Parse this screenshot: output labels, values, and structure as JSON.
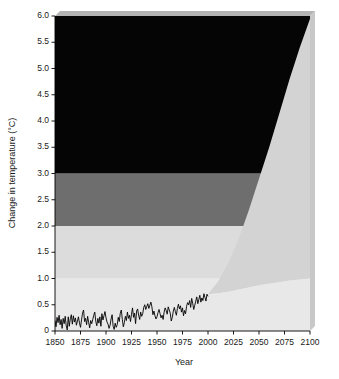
{
  "chart_data": {
    "type": "area",
    "title": "",
    "xlabel": "Year",
    "ylabel": "Change in temperature (°C)",
    "xlim": [
      1850,
      2100
    ],
    "ylim": [
      0,
      6.0
    ],
    "grid": false,
    "legend": "none",
    "xticks": [
      1850,
      1875,
      1900,
      1925,
      1950,
      1975,
      2000,
      2025,
      2050,
      2075,
      2100
    ],
    "xtick_labels": [
      "1850",
      "1875",
      "1900",
      "1925",
      "1950",
      "1975",
      "2000",
      "2025",
      "2050",
      "2075",
      "2100"
    ],
    "yticks": [
      0,
      0.5,
      1.0,
      1.5,
      2.0,
      2.5,
      3.0,
      3.5,
      4.0,
      4.5,
      5.0,
      5.5,
      6.0
    ],
    "ytick_labels": [
      "0",
      "0.5",
      "1.0",
      "1.5",
      "2.0",
      "2.5",
      "3.0",
      "3.5",
      "4.0",
      "4.5",
      "5.0",
      "5.5",
      "6.0"
    ],
    "risk_bands": [
      {
        "name": "low-risk-band",
        "from": 0,
        "to": 1.0,
        "color": "#e8e8e8"
      },
      {
        "name": "moderate-risk-band",
        "from": 1.0,
        "to": 2.0,
        "color": "#dcdcdc"
      },
      {
        "name": "high-risk-band",
        "from": 2.0,
        "to": 3.0,
        "color": "#6e6e6e"
      },
      {
        "name": "severe-risk-band",
        "from": 3.0,
        "to": 6.0,
        "color": "#050505"
      }
    ],
    "projection_cone": {
      "name": "projection-uncertainty-cone",
      "color": "#d3d3d3",
      "start_year": 2000,
      "start_value": 0.7,
      "upper_bound": {
        "x": [
          2000,
          2010,
          2020,
          2030,
          2040,
          2050,
          2060,
          2070,
          2080,
          2090,
          2100
        ],
        "y": [
          0.7,
          0.95,
          1.3,
          1.75,
          2.3,
          2.9,
          3.5,
          4.15,
          4.8,
          5.4,
          5.95
        ]
      },
      "lower_bound": {
        "x": [
          2000,
          2010,
          2020,
          2030,
          2040,
          2050,
          2060,
          2070,
          2080,
          2090,
          2100
        ],
        "y": [
          0.7,
          0.72,
          0.75,
          0.79,
          0.83,
          0.87,
          0.9,
          0.93,
          0.96,
          0.98,
          1.0
        ]
      }
    },
    "series": [
      {
        "name": "observed-temperature",
        "color": "#000000",
        "x": [
          1850,
          1851,
          1852,
          1853,
          1854,
          1855,
          1856,
          1857,
          1858,
          1859,
          1860,
          1861,
          1862,
          1863,
          1864,
          1865,
          1866,
          1867,
          1868,
          1869,
          1870,
          1871,
          1872,
          1873,
          1874,
          1875,
          1876,
          1877,
          1878,
          1879,
          1880,
          1881,
          1882,
          1883,
          1884,
          1885,
          1886,
          1887,
          1888,
          1889,
          1890,
          1891,
          1892,
          1893,
          1894,
          1895,
          1896,
          1897,
          1898,
          1899,
          1900,
          1901,
          1902,
          1903,
          1904,
          1905,
          1906,
          1907,
          1908,
          1909,
          1910,
          1911,
          1912,
          1913,
          1914,
          1915,
          1916,
          1917,
          1918,
          1919,
          1920,
          1921,
          1922,
          1923,
          1924,
          1925,
          1926,
          1927,
          1928,
          1929,
          1930,
          1931,
          1932,
          1933,
          1934,
          1935,
          1936,
          1937,
          1938,
          1939,
          1940,
          1941,
          1942,
          1943,
          1944,
          1945,
          1946,
          1947,
          1948,
          1949,
          1950,
          1951,
          1952,
          1953,
          1954,
          1955,
          1956,
          1957,
          1958,
          1959,
          1960,
          1961,
          1962,
          1963,
          1964,
          1965,
          1966,
          1967,
          1968,
          1969,
          1970,
          1971,
          1972,
          1973,
          1974,
          1975,
          1976,
          1977,
          1978,
          1979,
          1980,
          1981,
          1982,
          1983,
          1984,
          1985,
          1986,
          1987,
          1988,
          1989,
          1990,
          1991,
          1992,
          1993,
          1994,
          1995,
          1996,
          1997,
          1998,
          1999,
          2000
        ],
        "y": [
          0.2,
          0.08,
          0.26,
          0.16,
          0.3,
          0.12,
          0.22,
          0.05,
          0.24,
          0.14,
          0.28,
          0.1,
          0.02,
          0.27,
          0.09,
          0.23,
          0.31,
          0.13,
          0.29,
          0.17,
          0.25,
          0.11,
          0.19,
          0.27,
          0.15,
          0.07,
          0.21,
          0.34,
          0.4,
          0.18,
          0.24,
          0.12,
          0.28,
          0.16,
          0.06,
          0.2,
          0.14,
          0.22,
          0.3,
          0.36,
          0.18,
          0.1,
          0.24,
          0.15,
          0.27,
          0.09,
          0.33,
          0.21,
          0.29,
          0.37,
          0.25,
          0.17,
          0.13,
          0.05,
          0.11,
          0.23,
          0.31,
          0.09,
          0.03,
          0.15,
          0.07,
          0.12,
          0.26,
          0.18,
          0.34,
          0.4,
          0.22,
          0.08,
          0.16,
          0.28,
          0.2,
          0.36,
          0.24,
          0.3,
          0.18,
          0.32,
          0.44,
          0.26,
          0.34,
          0.14,
          0.38,
          0.42,
          0.3,
          0.22,
          0.36,
          0.28,
          0.33,
          0.45,
          0.5,
          0.41,
          0.47,
          0.52,
          0.43,
          0.49,
          0.55,
          0.46,
          0.31,
          0.38,
          0.29,
          0.23,
          0.27,
          0.35,
          0.41,
          0.33,
          0.25,
          0.3,
          0.22,
          0.36,
          0.44,
          0.39,
          0.32,
          0.46,
          0.4,
          0.34,
          0.19,
          0.26,
          0.38,
          0.45,
          0.37,
          0.3,
          0.43,
          0.51,
          0.42,
          0.48,
          0.36,
          0.44,
          0.29,
          0.39,
          0.33,
          0.47,
          0.54,
          0.5,
          0.58,
          0.45,
          0.62,
          0.53,
          0.41,
          0.49,
          0.57,
          0.65,
          0.52,
          0.6,
          0.68,
          0.55,
          0.63,
          0.58,
          0.71,
          0.64,
          0.57,
          0.7,
          0.66
        ]
      }
    ]
  },
  "annotations": {
    "y_axis_title": "Change in temperature (°C)",
    "x_axis_title": "Year"
  }
}
